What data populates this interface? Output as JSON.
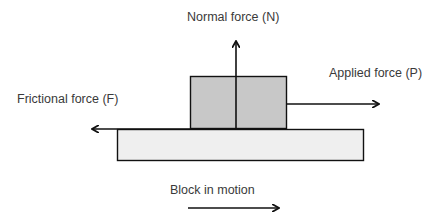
{
  "diagram": {
    "labels": {
      "normal_force": "Normal force (N)",
      "applied_force": "Applied force (P)",
      "frictional_force": "Frictional force (F)",
      "motion": "Block in motion"
    },
    "colors": {
      "block_fill": "#c8c8c8",
      "surface_fill": "#efefef",
      "stroke": "#111111",
      "text": "#3a3a3a",
      "background": "#ffffff"
    },
    "elements": {
      "block": {
        "x": 190,
        "y": 76,
        "width": 97,
        "height": 53
      },
      "surface": {
        "x": 117,
        "y": 129,
        "width": 247,
        "height": 32
      },
      "normal_arrow": {
        "x": 236,
        "y_from": 129,
        "y_to": 41,
        "direction": "up"
      },
      "applied_arrow": {
        "y": 104,
        "x_from": 287,
        "x_to": 379,
        "direction": "right"
      },
      "friction_arrow": {
        "y": 129,
        "x_from": 190,
        "x_to": 92,
        "direction": "left"
      },
      "motion_arrow": {
        "y": 208,
        "x_from": 188,
        "x_to": 279,
        "direction": "right"
      }
    }
  }
}
